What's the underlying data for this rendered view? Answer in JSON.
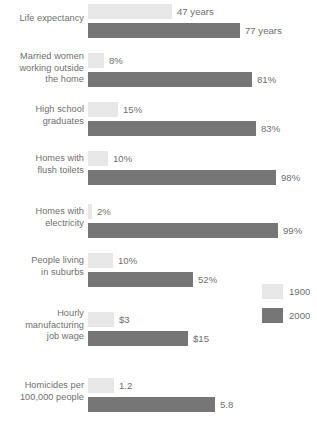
{
  "chart_data": {
    "type": "bar",
    "title": "",
    "xlabel": "",
    "ylabel": "",
    "orientation": "horizontal",
    "grid": false,
    "legend_position": "middle-right",
    "categories": [
      "Life expectancy",
      "Married women working outside the home",
      "High school graduates",
      "Homes with flush toilets",
      "Homes with electricity",
      "People living in suburbs",
      "Hourly manufacturing job wage",
      "Homicides per 100,000 people"
    ],
    "series": [
      {
        "name": "1900",
        "color": "#e7e7e7",
        "values": [
          47,
          8,
          15,
          10,
          2,
          10,
          3,
          1.2
        ],
        "value_labels": [
          "47 years",
          "8%",
          "15%",
          "10%",
          "2%",
          "10%",
          "$3",
          "1.2"
        ]
      },
      {
        "name": "2000",
        "color": "#767676",
        "values": [
          77,
          81,
          83,
          98,
          99,
          52,
          15,
          5.8
        ],
        "value_labels": [
          "77 years",
          "81%",
          "83%",
          "98%",
          "99%",
          "52%",
          "$15",
          "5.8"
        ]
      }
    ]
  },
  "rows": [
    {
      "label_lines": [
        "Life expectancy"
      ],
      "label_top": 13,
      "top": 4,
      "old": {
        "value_label": "47 years",
        "width": 84
      },
      "new": {
        "value_label": "77 years",
        "width": 152
      }
    },
    {
      "label_lines": [
        "Married women",
        "working outside",
        "the home"
      ],
      "label_top": 51,
      "top": 53,
      "old": {
        "value_label": "8%",
        "width": 16
      },
      "new": {
        "value_label": "81%",
        "width": 164
      }
    },
    {
      "label_lines": [
        "High school",
        "graduates"
      ],
      "label_top": 104,
      "top": 102,
      "old": {
        "value_label": "15%",
        "width": 30
      },
      "new": {
        "value_label": "83%",
        "width": 168
      }
    },
    {
      "label_lines": [
        "Homes with",
        "flush toilets"
      ],
      "label_top": 153,
      "top": 151,
      "old": {
        "value_label": "10%",
        "width": 20
      },
      "new": {
        "value_label": "98%",
        "width": 188
      }
    },
    {
      "label_lines": [
        "Homes with",
        "electricity"
      ],
      "label_top": 206,
      "top": 204,
      "old": {
        "value_label": "2%",
        "width": 4
      },
      "new": {
        "value_label": "99%",
        "width": 190
      }
    },
    {
      "label_lines": [
        "People living",
        "in suburbs"
      ],
      "label_top": 255,
      "top": 253,
      "old": {
        "value_label": "10%",
        "width": 25
      },
      "new": {
        "value_label": "52%",
        "width": 105
      }
    },
    {
      "label_lines": [
        "Hourly",
        "manufacturing",
        "job wage"
      ],
      "label_top": 308,
      "top": 312,
      "old": {
        "value_label": "$3",
        "width": 26
      },
      "new": {
        "value_label": "$15",
        "width": 100
      }
    },
    {
      "label_lines": [
        "Homicides per",
        "100,000 people"
      ],
      "label_top": 380,
      "top": 378,
      "old": {
        "value_label": "1.2",
        "width": 26
      },
      "new": {
        "value_label": "5.8",
        "width": 127
      }
    }
  ],
  "legend": {
    "items": [
      {
        "label": "1900",
        "color": "#e7e7e7"
      },
      {
        "label": "2000",
        "color": "#767676"
      }
    ]
  },
  "colors": {
    "old_series": "#e7e7e7",
    "new_series": "#767676",
    "text": "#6f6f6f",
    "background": "#ffffff"
  }
}
